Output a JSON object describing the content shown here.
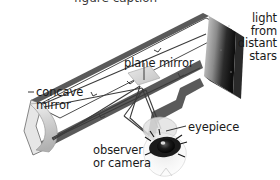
{
  "diagram": {
    "type": "optics-schematic",
    "background": "#ffffff",
    "colors": {
      "tube_wall": "#4d4d4d",
      "tube_interior": "#ffffff",
      "aperture_dark": "#141414",
      "aperture_light": "#d8d8d8",
      "mirror_gray": "#cfcfcf",
      "ray": "#3b3b3b",
      "text": "#1a1a1a",
      "eye_dark": "#111111"
    },
    "labels": {
      "light_from_stars": "light\nfrom\ndistant\nstars",
      "plane_mirror": "plane mirror",
      "concave_mirror": "concave\nmirror",
      "eyepiece": "eyepiece",
      "observer_or_camera": "observer\nor camera"
    },
    "parts": [
      {
        "name": "telescope-tube",
        "description": "long tilted open tube"
      },
      {
        "name": "aperture",
        "description": "dark open end facing distant stars"
      },
      {
        "name": "concave-mirror",
        "description": "curved primary mirror at closed lower-left end"
      },
      {
        "name": "plane-mirror",
        "description": "small flat secondary mirror angled inside tube"
      },
      {
        "name": "eyepiece",
        "description": "lens in side port of tube"
      },
      {
        "name": "observer-eye",
        "description": "eye of observer or camera below eyepiece"
      }
    ],
    "rays": {
      "count": 4,
      "description": "parallel starlight enters aperture, reflects off concave mirror, converges on plane mirror, is diverted down through eyepiece to the eye",
      "tick_marks": "direction ticks along ray paths"
    }
  }
}
